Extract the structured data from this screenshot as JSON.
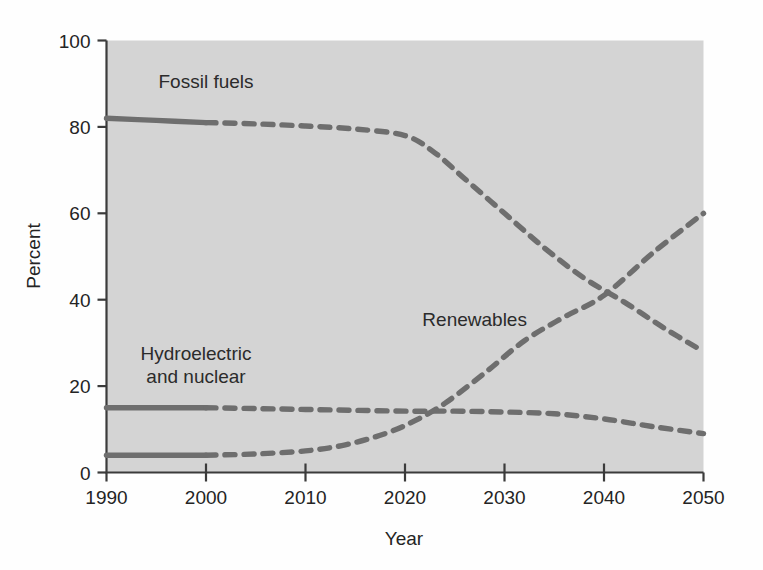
{
  "chart_data": {
    "type": "line",
    "title": "",
    "xlabel": "Year",
    "ylabel": "Percent",
    "xlim": [
      1990,
      2050
    ],
    "ylim": [
      0,
      100
    ],
    "grid": false,
    "legend_position": "inline-annotations",
    "plot_background": "#d4d4d4",
    "line_color": "#6e6e6e",
    "axis_color": "#3b3b3b",
    "xticks": [
      1990,
      2000,
      2010,
      2020,
      2030,
      2040,
      2050
    ],
    "xtick_labels": [
      "1990",
      "2000",
      "2010",
      "2020",
      "2030",
      "2040",
      "2050"
    ],
    "yticks": [
      0,
      20,
      40,
      60,
      80,
      100
    ],
    "ytick_labels": [
      "0",
      "20",
      "40",
      "60",
      "80",
      "100"
    ],
    "historical_end_year": 2000,
    "series": [
      {
        "name": "Fossil fuels",
        "label": "Fossil fuels",
        "label_x": 2000,
        "label_y": 89,
        "x": [
          1990,
          1995,
          2000,
          2005,
          2010,
          2015,
          2020,
          2023,
          2026,
          2030,
          2034,
          2038,
          2042,
          2046,
          2050
        ],
        "values": [
          82,
          81.5,
          81,
          80.7,
          80.2,
          79.5,
          78,
          74,
          68,
          60,
          52,
          45,
          39.5,
          33.5,
          28
        ]
      },
      {
        "name": "Hydroelectric and nuclear",
        "label": "Hydroelectric and nuclear",
        "label_x": 2000,
        "label_y": 26,
        "x": [
          1990,
          1995,
          2000,
          2005,
          2010,
          2015,
          2020,
          2025,
          2030,
          2035,
          2040,
          2045,
          2050
        ],
        "values": [
          15,
          15,
          15,
          14.8,
          14.6,
          14.4,
          14.2,
          14.2,
          14,
          13.6,
          12.4,
          10.6,
          9
        ]
      },
      {
        "name": "Renewables",
        "label": "Renewables",
        "label_x": 2027,
        "label_y": 34,
        "x": [
          1990,
          1995,
          2000,
          2005,
          2010,
          2014,
          2018,
          2021,
          2024,
          2028,
          2032,
          2036,
          2040,
          2045,
          2050
        ],
        "values": [
          4,
          4,
          4,
          4.3,
          5,
          6.4,
          9,
          12,
          16,
          23,
          30.5,
          36,
          41,
          51,
          60
        ]
      }
    ],
    "crossover": {
      "year": 2043,
      "value": 42,
      "between": [
        "Fossil fuels",
        "Renewables"
      ]
    }
  }
}
